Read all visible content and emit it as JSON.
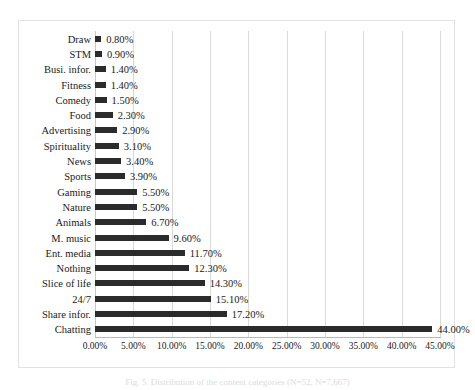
{
  "figure": {
    "caption": "Fig. 5. Distribution of the content categories (N=52, N=7,667)"
  },
  "chart_data": {
    "type": "bar",
    "orientation": "horizontal",
    "title": "",
    "xlabel": "",
    "ylabel": "",
    "xlim": [
      0,
      45
    ],
    "grid": true,
    "legend": "none",
    "bar_color": "#2b2b2b",
    "value_suffix": "%",
    "xticks": [
      "0.00%",
      "5.00%",
      "10.00%",
      "15.00%",
      "20.00%",
      "25.00%",
      "30.00%",
      "35.00%",
      "40.00%",
      "45.00%"
    ],
    "xtick_values": [
      0,
      5,
      10,
      15,
      20,
      25,
      30,
      35,
      40,
      45
    ],
    "categories": [
      "Draw",
      "STM",
      "Busi. infor.",
      "Fitness",
      "Comedy",
      "Food",
      "Advertising",
      "Spirituality",
      "News",
      "Sports",
      "Gaming",
      "Nature",
      "Animals",
      "M. music",
      "Ent. media",
      "Nothing",
      "Slice of life",
      "24/7",
      "Share infor.",
      "Chatting"
    ],
    "values": [
      0.8,
      0.9,
      1.4,
      1.4,
      1.5,
      2.3,
      2.9,
      3.1,
      3.4,
      3.9,
      5.5,
      5.5,
      6.7,
      9.6,
      11.7,
      12.3,
      14.3,
      15.1,
      17.2,
      44.0
    ],
    "labels": [
      "0.80%",
      "0.90%",
      "1.40%",
      "1.40%",
      "1.50%",
      "2.30%",
      "2.90%",
      "3.10%",
      "3.40%",
      "3.90%",
      "5.50%",
      "5.50%",
      "6.70%",
      "9.60%",
      "11.70%",
      "12.30%",
      "14.30%",
      "15.10%",
      "17.20%",
      "44.00%"
    ]
  }
}
